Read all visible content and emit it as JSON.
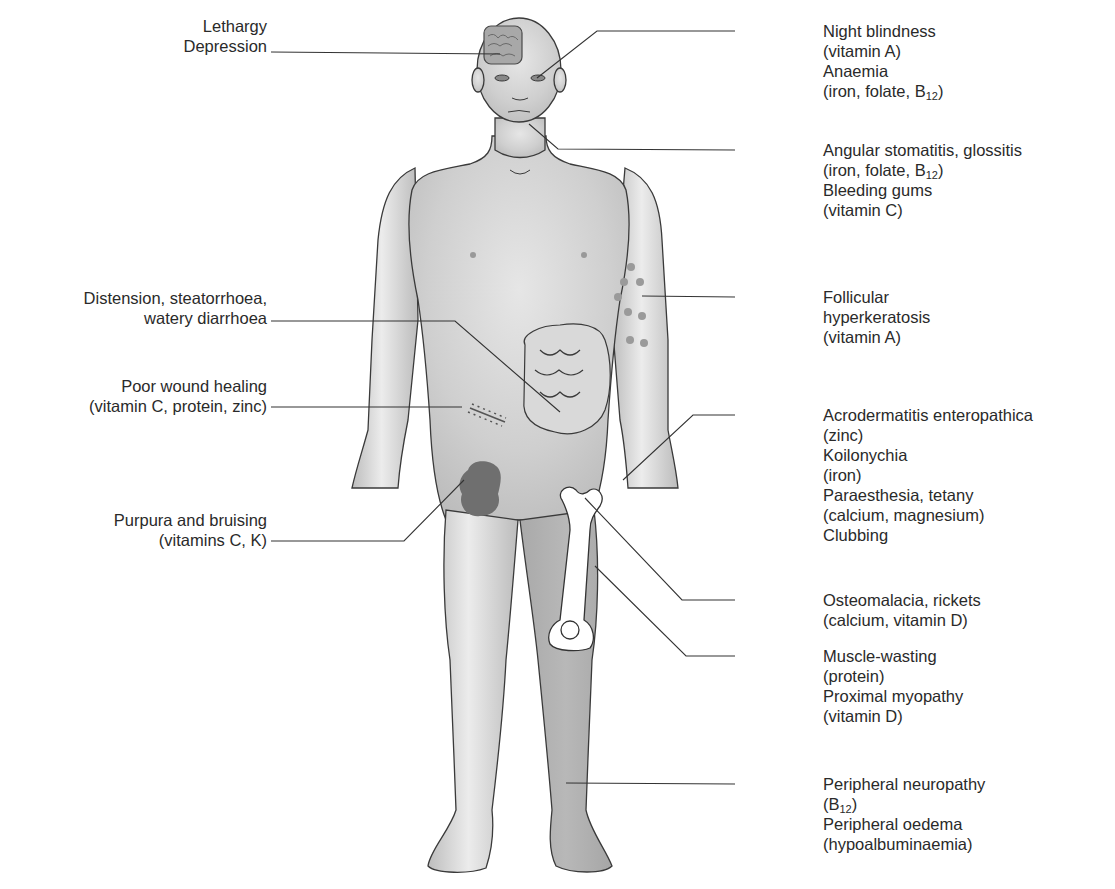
{
  "figure": {
    "colors": {
      "skin": "#c9c9c9",
      "skin_highlight": "#eeeeee",
      "outline": "#3a3a3a",
      "leader_line": "#333333",
      "bruise": "#6f6f6f",
      "bone": "#ffffff",
      "text": "#2a2a2a"
    }
  },
  "labels_left": [
    {
      "id": "brain",
      "lines": [
        "Lethargy",
        "Depression"
      ]
    },
    {
      "id": "abdomen",
      "lines": [
        "Distension, steatorrhoea,",
        "watery diarrhoea"
      ]
    },
    {
      "id": "wound",
      "lines": [
        "Poor wound healing",
        "(vitamin C, protein, zinc)"
      ]
    },
    {
      "id": "bruise",
      "lines": [
        "Purpura and bruising",
        "(vitamins C, K)"
      ]
    }
  ],
  "labels_right": [
    {
      "id": "eyes",
      "lines": [
        "Night blindness",
        "(vitamin A)",
        "Anaemia",
        "(iron, folate, B",
        "12",
        ")"
      ]
    },
    {
      "id": "mouth",
      "lines": [
        "Angular stomatitis, glossitis",
        "(iron, folate, B",
        "12",
        ")",
        "Bleeding gums",
        "(vitamin C)"
      ]
    },
    {
      "id": "arm",
      "lines": [
        "Follicular",
        "hyperkeratosis",
        "(vitamin A)"
      ]
    },
    {
      "id": "hand",
      "lines": [
        "Acrodermatitis enteropathica",
        "(zinc)",
        "Koilonychia",
        "(iron)",
        "Paraesthesia, tetany",
        "(calcium, magnesium)",
        "Clubbing"
      ]
    },
    {
      "id": "bone",
      "lines": [
        "Osteomalacia, rickets",
        "(calcium, vitamin D)"
      ]
    },
    {
      "id": "muscle",
      "lines": [
        "Muscle-wasting",
        "(protein)",
        "Proximal myopathy",
        "(vitamin D)"
      ]
    },
    {
      "id": "leg",
      "lines": [
        "Peripheral neuropathy",
        "(B",
        "12",
        ")",
        "Peripheral oedema",
        "(hypoalbuminaemia)"
      ]
    }
  ]
}
